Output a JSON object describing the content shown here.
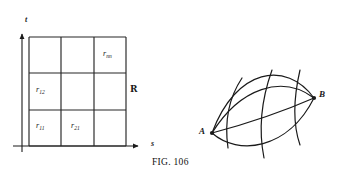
{
  "figure": {
    "caption": "FIG. 106",
    "left_panel": {
      "name": "rectangular-grid-diagram",
      "axis_vertical_label": "t",
      "axis_horizontal_label": "s",
      "region_label": "R",
      "grid_rows": 3,
      "grid_cols": 3,
      "cell_labels": [
        {
          "text": "r",
          "sub": "11",
          "col": 0,
          "row": 0
        },
        {
          "text": "r",
          "sub": "21",
          "col": 1,
          "row": 0
        },
        {
          "text": "r",
          "sub": "12",
          "col": 0,
          "row": 1
        },
        {
          "text": "r",
          "sub": "nn",
          "col": 2,
          "row": 2
        }
      ]
    },
    "right_panel": {
      "name": "lens-curvilinear-diagram",
      "node_left_label": "A",
      "node_right_label": "B",
      "longitudinal_curves": 4,
      "transverse_curves": 3
    }
  },
  "colors": {
    "ink": "#1a1a1a",
    "line": "#262626",
    "background": "#ffffff"
  }
}
